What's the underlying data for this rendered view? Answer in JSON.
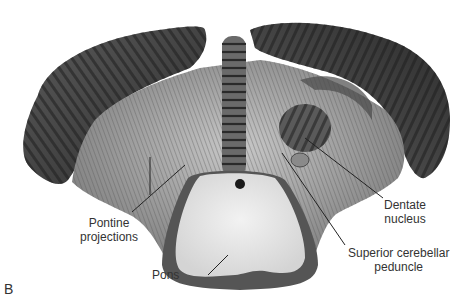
{
  "figure": {
    "panel_letter": "B",
    "labels": [
      {
        "id": "pontine-projections",
        "lines": [
          "Pontine",
          "projections"
        ]
      },
      {
        "id": "pons",
        "lines": [
          "Pons"
        ]
      },
      {
        "id": "dentate-nucleus",
        "lines": [
          "Dentate",
          "nucleus"
        ]
      },
      {
        "id": "superior-cerebellar-peduncle",
        "lines": [
          "Superior cerebellar",
          "peduncle"
        ]
      }
    ]
  },
  "colors": {
    "background": "#ffffff",
    "folia_dark": "#3a3a3a",
    "folia_mid": "#6e6e6e",
    "white_matter": "#a8a8a8",
    "pons_cut": "#e6e6e6",
    "text": "#333333",
    "leader_line": "#222222"
  }
}
